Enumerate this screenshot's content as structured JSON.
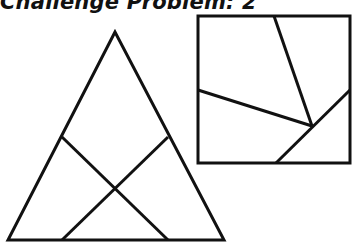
{
  "title": "Challenge Problem: 2",
  "colors": {
    "stroke": "#111111",
    "background": "#ffffff"
  },
  "figures": {
    "triangle": {
      "vertices": [
        [
          115,
          32
        ],
        [
          8,
          240
        ],
        [
          224,
          240
        ]
      ],
      "inner_lines": [
        {
          "from": [
            62,
            137
          ],
          "to": [
            168,
            240
          ]
        },
        {
          "from": [
            168,
            137
          ],
          "to": [
            62,
            240
          ]
        }
      ]
    },
    "square": {
      "x": 198,
      "y": 16,
      "width": 152,
      "height": 147,
      "inner_lines": [
        {
          "from": [
            274,
            16
          ],
          "to": [
            312,
            126
          ]
        },
        {
          "from": [
            198,
            90
          ],
          "to": [
            312,
            126
          ]
        },
        {
          "from": [
            350,
            90
          ],
          "to": [
            276,
            163
          ]
        }
      ]
    }
  }
}
